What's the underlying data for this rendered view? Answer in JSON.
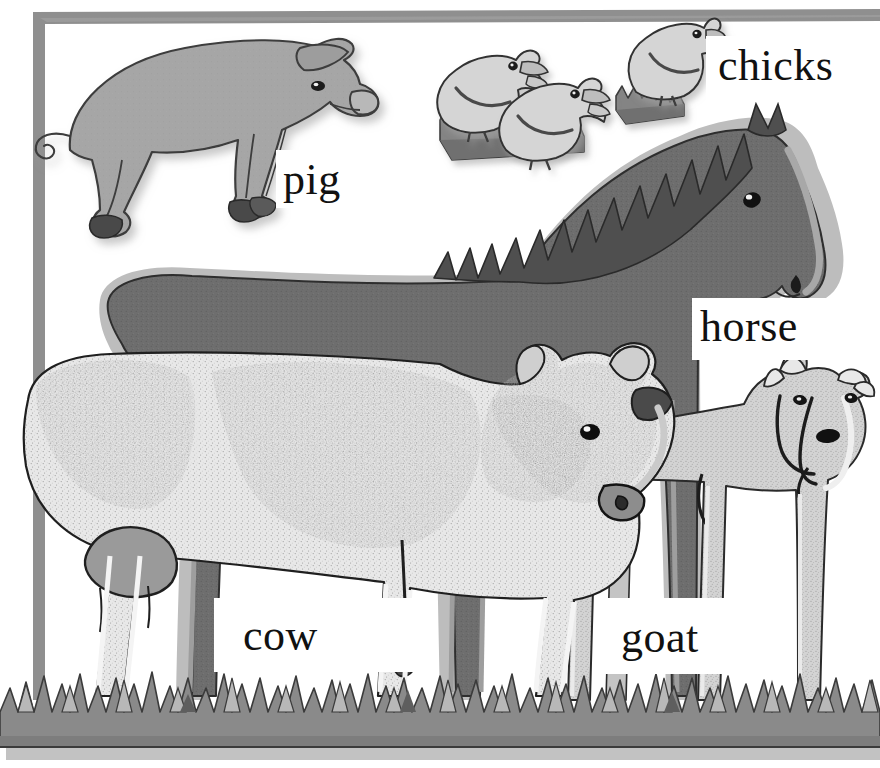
{
  "scene": {
    "title": "Farm animals picture dictionary page",
    "background_color": "#ffffff",
    "frame_color": "#8c8c8c",
    "ground_color": "#8a8a8a",
    "ground_shadow_color": "#b5b5b5"
  },
  "labels": {
    "pig": "pig",
    "chicks": "chicks",
    "horse": "horse",
    "cow": "cow",
    "goat": "goat"
  },
  "animals": [
    {
      "name": "pig",
      "label": "pig",
      "body_color": "#a5a5a5",
      "outline_color": "#3a3a3a",
      "hoof_color": "#4a4a4a",
      "count": 1
    },
    {
      "name": "chicks",
      "label": "chicks",
      "body_color": "#d2d2d2",
      "outline_color": "#3a3a3a",
      "grass_color": "#7e7e7e",
      "count": 3
    },
    {
      "name": "horse",
      "label": "horse",
      "body_color": "#6b6b6b",
      "mane_color": "#4d4d4d",
      "outline_color": "#2f2f2f",
      "count": 1
    },
    {
      "name": "cow",
      "label": "cow",
      "body_color": "#e2e2e2",
      "patch_color": "#2b2b2b",
      "udder_color": "#9a9a9a",
      "outline_color": "#1f1f1f",
      "count": 1
    },
    {
      "name": "goat",
      "label": "goat",
      "body_color": "#cfcfcf",
      "horn_color": "#e6e6e6",
      "outline_color": "#2a2a2a",
      "count": 1
    }
  ],
  "icons": {
    "pig": "pig-icon",
    "chicks": "chick-icon",
    "horse": "horse-icon",
    "cow": "cow-icon",
    "goat": "goat-icon",
    "grass": "grass-icon",
    "frame": "frame-icon"
  }
}
